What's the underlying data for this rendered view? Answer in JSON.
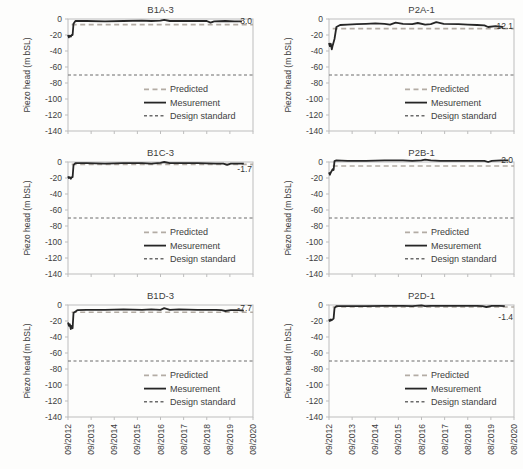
{
  "figure": {
    "ylabel": "Piezo head (m bSL)",
    "legend": [
      {
        "name": "Predicted",
        "style": "dashed",
        "color": "#b3aca4"
      },
      {
        "name": "Mesurement",
        "style": "solid",
        "color": "#262626"
      },
      {
        "name": "Design standard",
        "style": "dashed-short",
        "color": "#6b6b6b"
      }
    ],
    "colors": {
      "measurement": "#262626",
      "predicted": "#b3aca4",
      "design_standard": "#6b6b6b",
      "axis_border": "#bdbdbd",
      "text": "#404040"
    }
  },
  "chart_data": [
    {
      "type": "line",
      "title": "B1A-3",
      "ylabel": "Piezo head (m bSL)",
      "ylim": [
        -140,
        0
      ],
      "yticks": [
        0,
        -20,
        -40,
        -60,
        -80,
        -100,
        -120,
        -140
      ],
      "x_ticklabels": [
        "09/2012",
        "09/2013",
        "09/2014",
        "09/2015",
        "08/2016",
        "08/2017",
        "08/2018",
        "08/2019",
        "08/2020"
      ],
      "show_x_labels": false,
      "design_standard_level": -70,
      "predicted_level": -7,
      "annotation": {
        "text": "-3.0",
        "y": -2
      },
      "measurement": [
        [
          0,
          -20
        ],
        [
          0.005,
          -23
        ],
        [
          0.01,
          -21
        ],
        [
          0.015,
          -22
        ],
        [
          0.02,
          -20
        ],
        [
          0.025,
          -20
        ],
        [
          0.03,
          -6
        ],
        [
          0.04,
          -2.5
        ],
        [
          0.1,
          -2.5
        ],
        [
          0.2,
          -3
        ],
        [
          0.3,
          -2.5
        ],
        [
          0.4,
          -2
        ],
        [
          0.45,
          -2.5
        ],
        [
          0.5,
          -2
        ],
        [
          0.52,
          -1
        ],
        [
          0.55,
          -2.5
        ],
        [
          0.6,
          -2.5
        ],
        [
          0.7,
          -2.5
        ],
        [
          0.75,
          -2.5
        ],
        [
          0.77,
          -4.5
        ],
        [
          0.79,
          -3
        ],
        [
          0.85,
          -2.5
        ],
        [
          0.9,
          -3
        ],
        [
          0.94,
          -3
        ]
      ]
    },
    {
      "type": "line",
      "title": "P2A-1",
      "ylabel": "Piezo head (m bSL)",
      "ylim": [
        -140,
        0
      ],
      "yticks": [
        0,
        -20,
        -40,
        -60,
        -80,
        -100,
        -120,
        -140
      ],
      "x_ticklabels": [
        "09/2012",
        "09/2013",
        "09/2014",
        "09/2015",
        "08/2016",
        "08/2017",
        "08/2018",
        "08/2019",
        "08/2020"
      ],
      "show_x_labels": false,
      "design_standard_level": -70,
      "predicted_level": -12,
      "annotation": {
        "text": "-12.1",
        "y": -9
      },
      "measurement": [
        [
          0,
          -30
        ],
        [
          0.005,
          -34
        ],
        [
          0.01,
          -31
        ],
        [
          0.015,
          -38
        ],
        [
          0.02,
          -33
        ],
        [
          0.03,
          -25
        ],
        [
          0.04,
          -10
        ],
        [
          0.06,
          -7.5
        ],
        [
          0.1,
          -7
        ],
        [
          0.15,
          -6.5
        ],
        [
          0.2,
          -6
        ],
        [
          0.25,
          -5.5
        ],
        [
          0.3,
          -6
        ],
        [
          0.33,
          -7
        ],
        [
          0.36,
          -4.5
        ],
        [
          0.4,
          -6
        ],
        [
          0.45,
          -6.5
        ],
        [
          0.48,
          -5
        ],
        [
          0.52,
          -7
        ],
        [
          0.55,
          -6.5
        ],
        [
          0.58,
          -4
        ],
        [
          0.62,
          -6
        ],
        [
          0.7,
          -6.5
        ],
        [
          0.75,
          -7
        ],
        [
          0.8,
          -7.5
        ],
        [
          0.84,
          -8
        ],
        [
          0.86,
          -10
        ],
        [
          0.9,
          -9
        ],
        [
          0.94,
          -10
        ]
      ]
    },
    {
      "type": "line",
      "title": "B1C-3",
      "ylabel": "Piezo head (m bSL)",
      "ylim": [
        -140,
        0
      ],
      "yticks": [
        0,
        -20,
        -40,
        -60,
        -80,
        -100,
        -120,
        -140
      ],
      "x_ticklabels": [
        "09/2012",
        "09/2013",
        "09/2014",
        "09/2015",
        "08/2016",
        "08/2017",
        "08/2018",
        "08/2019",
        "08/2020"
      ],
      "show_x_labels": false,
      "design_standard_level": -70,
      "predicted_level": -3,
      "annotation": {
        "text": "-1.7",
        "y": -9
      },
      "measurement": [
        [
          0,
          -18
        ],
        [
          0.005,
          -20
        ],
        [
          0.01,
          -19
        ],
        [
          0.015,
          -21
        ],
        [
          0.02,
          -19
        ],
        [
          0.025,
          -19
        ],
        [
          0.03,
          -4
        ],
        [
          0.04,
          -1.5
        ],
        [
          0.1,
          -1.5
        ],
        [
          0.2,
          -2
        ],
        [
          0.3,
          -1.5
        ],
        [
          0.4,
          -1.5
        ],
        [
          0.45,
          -2
        ],
        [
          0.5,
          -1
        ],
        [
          0.52,
          0
        ],
        [
          0.55,
          -1.5
        ],
        [
          0.6,
          -1.5
        ],
        [
          0.7,
          -1.5
        ],
        [
          0.8,
          -2
        ],
        [
          0.84,
          -2
        ],
        [
          0.86,
          -3.5
        ],
        [
          0.88,
          -2
        ],
        [
          0.92,
          -2
        ],
        [
          0.95,
          -2
        ]
      ]
    },
    {
      "type": "line",
      "title": "P2B-1",
      "ylabel": "Piezo head (m bSL)",
      "ylim": [
        -140,
        0
      ],
      "yticks": [
        0,
        -20,
        -40,
        -60,
        -80,
        -100,
        -120,
        -140
      ],
      "x_ticklabels": [
        "09/2012",
        "09/2013",
        "09/2014",
        "09/2015",
        "08/2016",
        "08/2017",
        "08/2018",
        "08/2019",
        "08/2020"
      ],
      "show_x_labels": false,
      "design_standard_level": -70,
      "predicted_level": -5,
      "annotation": {
        "text": "2.0",
        "y": 2
      },
      "measurement": [
        [
          0,
          -13
        ],
        [
          0.005,
          -16
        ],
        [
          0.01,
          -13
        ],
        [
          0.015,
          -11
        ],
        [
          0.02,
          -9
        ],
        [
          0.025,
          -10
        ],
        [
          0.03,
          1
        ],
        [
          0.04,
          2
        ],
        [
          0.1,
          1.5
        ],
        [
          0.2,
          1.5
        ],
        [
          0.3,
          2
        ],
        [
          0.4,
          2
        ],
        [
          0.45,
          1.5
        ],
        [
          0.5,
          2
        ],
        [
          0.52,
          3
        ],
        [
          0.55,
          2
        ],
        [
          0.6,
          1.5
        ],
        [
          0.7,
          1.5
        ],
        [
          0.8,
          1.5
        ],
        [
          0.84,
          1.5
        ],
        [
          0.86,
          0
        ],
        [
          0.88,
          1.5
        ],
        [
          0.93,
          2
        ],
        [
          0.97,
          2
        ]
      ]
    },
    {
      "type": "line",
      "title": "B1D-3",
      "ylabel": "Piezo head (m bSL)",
      "ylim": [
        -140,
        0
      ],
      "yticks": [
        0,
        -20,
        -40,
        -60,
        -80,
        -100,
        -120,
        -140
      ],
      "x_ticklabels": [
        "09/2012",
        "09/2013",
        "09/2014",
        "09/2015",
        "08/2016",
        "08/2017",
        "08/2018",
        "08/2019",
        "08/2020"
      ],
      "show_x_labels": true,
      "design_standard_level": -70,
      "predicted_level": -9,
      "annotation": {
        "text": "-7.7",
        "y": -4
      },
      "measurement": [
        [
          0,
          -22
        ],
        [
          0.005,
          -26
        ],
        [
          0.01,
          -24
        ],
        [
          0.015,
          -30
        ],
        [
          0.02,
          -26
        ],
        [
          0.025,
          -29
        ],
        [
          0.03,
          -10
        ],
        [
          0.05,
          -6.5
        ],
        [
          0.1,
          -6
        ],
        [
          0.2,
          -6
        ],
        [
          0.3,
          -5.5
        ],
        [
          0.4,
          -6
        ],
        [
          0.45,
          -5.5
        ],
        [
          0.5,
          -6
        ],
        [
          0.52,
          -4
        ],
        [
          0.55,
          -6
        ],
        [
          0.6,
          -5.5
        ],
        [
          0.7,
          -6
        ],
        [
          0.8,
          -6
        ],
        [
          0.83,
          -6.5
        ],
        [
          0.85,
          -7.5
        ],
        [
          0.88,
          -6.5
        ],
        [
          0.92,
          -6.5
        ],
        [
          0.95,
          -7
        ]
      ]
    },
    {
      "type": "line",
      "title": "P2D-1",
      "ylabel": "Piezo head (m bSL)",
      "ylim": [
        -140,
        0
      ],
      "yticks": [
        0,
        -20,
        -40,
        -60,
        -80,
        -100,
        -120,
        -140
      ],
      "x_ticklabels": [
        "09/2012",
        "09/2013",
        "09/2014",
        "09/2015",
        "08/2016",
        "08/2017",
        "08/2018",
        "08/2019",
        "08/2020"
      ],
      "show_x_labels": true,
      "design_standard_level": -70,
      "predicted_level": -2.5,
      "annotation": {
        "text": "-1.4",
        "y": -15
      },
      "measurement": [
        [
          0,
          -18
        ],
        [
          0.005,
          -20
        ],
        [
          0.01,
          -18
        ],
        [
          0.015,
          -19
        ],
        [
          0.02,
          -18
        ],
        [
          0.025,
          -17
        ],
        [
          0.03,
          -4
        ],
        [
          0.04,
          -1.5
        ],
        [
          0.1,
          -1.5
        ],
        [
          0.2,
          -1.5
        ],
        [
          0.3,
          -1
        ],
        [
          0.4,
          -1
        ],
        [
          0.45,
          -1.5
        ],
        [
          0.5,
          -0.5
        ],
        [
          0.52,
          -1.5
        ],
        [
          0.55,
          -1
        ],
        [
          0.6,
          -1
        ],
        [
          0.7,
          -1
        ],
        [
          0.8,
          -1
        ],
        [
          0.83,
          -1.5
        ],
        [
          0.85,
          -2.5
        ],
        [
          0.88,
          -1
        ],
        [
          0.92,
          -1
        ],
        [
          0.95,
          -1.5
        ]
      ]
    }
  ]
}
